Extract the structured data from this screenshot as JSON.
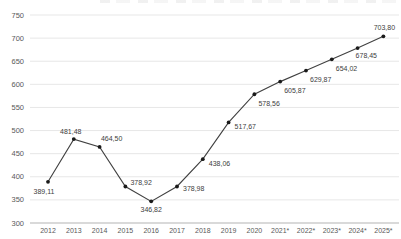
{
  "chart_data": {
    "type": "line",
    "title": "",
    "categories": [
      "2012",
      "2013",
      "2014",
      "2015",
      "2016",
      "2017",
      "2018",
      "2019",
      "2020",
      "2021*",
      "2022*",
      "2023*",
      "2024*",
      "2025*"
    ],
    "values": [
      389.11,
      481.48,
      464.5,
      378.92,
      346.82,
      378.98,
      438.06,
      517.67,
      578.56,
      605.87,
      629.87,
      654.02,
      678.45,
      703.8
    ],
    "point_labels": [
      "389,11",
      "481,48",
      "464,50",
      "378,92",
      "346,82",
      "378,98",
      "438,06",
      "517,67",
      "578,56",
      "605,87",
      "629,87",
      "654,02",
      "678,45",
      "703,80"
    ],
    "y_ticks": [
      750,
      700,
      650,
      600,
      550,
      500,
      450,
      400,
      350,
      300
    ],
    "ylim": [
      300,
      750
    ],
    "grid": true,
    "legend": false,
    "xlabel": "",
    "ylabel": "",
    "colors": {
      "series_line": "#404040",
      "marker": "#1a1a1a",
      "gridline": "#e7e7e7",
      "axis_line": "#b3b3b3",
      "tick_label": "#595959",
      "data_label": "#404040",
      "background": "#ffffff"
    },
    "label_layout": [
      [
        -4,
        12,
        "middle"
      ],
      [
        -3,
        -5,
        "middle"
      ],
      [
        12,
        -6,
        "middle"
      ],
      [
        5,
        -2,
        "start"
      ],
      [
        0,
        11,
        "middle"
      ],
      [
        6,
        5,
        "start"
      ],
      [
        6,
        7,
        "start"
      ],
      [
        6,
        7,
        "start"
      ],
      [
        4,
        12,
        "start"
      ],
      [
        4,
        11,
        "start"
      ],
      [
        4,
        11,
        "start"
      ],
      [
        4,
        12,
        "start"
      ],
      [
        -2,
        10,
        "start"
      ],
      [
        1,
        -6,
        "middle"
      ]
    ]
  }
}
